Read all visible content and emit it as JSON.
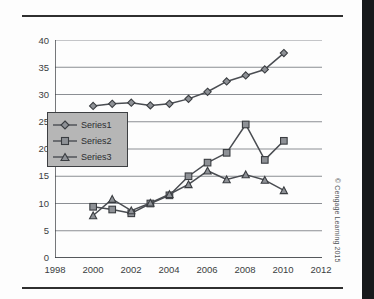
{
  "figure": {
    "copyright": "© Cengage Learning 2015",
    "colors": {
      "line": "#4a4d52",
      "marker_fill": "#8e9196",
      "marker_stroke": "#3a3d41",
      "grid": "#8b8e93",
      "axis": "#3a3d41",
      "legend_fill": "#b6b6b6",
      "legend_border": "#3d3f42",
      "rule": "#2f2f2f",
      "text": "#3a3d41",
      "right_band": "#17191b"
    }
  },
  "chart_data": {
    "type": "line",
    "title": "",
    "subtitle": "",
    "xlabel": "",
    "ylabel": "",
    "xlim": [
      1998,
      2012
    ],
    "ylim": [
      0,
      40
    ],
    "xticks": [
      1998,
      2000,
      2002,
      2004,
      2006,
      2008,
      2010,
      2012
    ],
    "yticks": [
      0,
      5,
      10,
      15,
      20,
      25,
      30,
      35,
      40
    ],
    "xtick_labels": [
      "1998",
      "2000",
      "2002",
      "2004",
      "2006",
      "2008",
      "2010",
      "2012"
    ],
    "ytick_labels": [
      "0",
      "5",
      "10",
      "15",
      "20",
      "25",
      "30",
      "35",
      "40"
    ],
    "grid": "horizontal",
    "legend_position": "center-left",
    "x": [
      2000,
      2001,
      2002,
      2003,
      2004,
      2005,
      2006,
      2007,
      2008,
      2009,
      2010
    ],
    "series": [
      {
        "name": "Series1",
        "marker": "diamond",
        "values": [
          27.9,
          28.3,
          28.5,
          28.0,
          28.3,
          29.2,
          30.5,
          32.4,
          33.5,
          34.6,
          37.6
        ]
      },
      {
        "name": "Series2",
        "marker": "square",
        "values": [
          9.4,
          8.9,
          8.2,
          10.0,
          11.5,
          15.0,
          17.5,
          19.3,
          24.5,
          18.0,
          21.5
        ]
      },
      {
        "name": "Series3",
        "marker": "triangle",
        "values": [
          7.8,
          10.8,
          8.7,
          10.1,
          11.7,
          13.5,
          16.0,
          14.4,
          15.3,
          14.3,
          12.4
        ]
      }
    ]
  }
}
